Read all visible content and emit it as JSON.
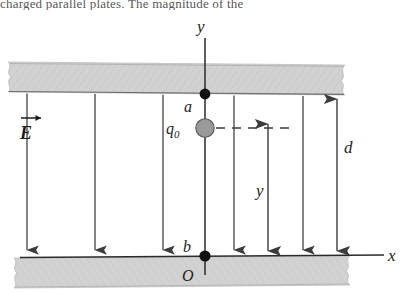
{
  "figure": {
    "kind": "physics-diagram",
    "clipped_caption_text": "charged parallel plates.  The magnitude of the",
    "background_color": "#ffffff",
    "ink_color": "#1d1d1d"
  },
  "plates": {
    "top": {
      "name": "upper charged plate",
      "fill_color": "#d0d0d0",
      "edge_style": "torn-jagged"
    },
    "bottom": {
      "name": "lower charged plate",
      "fill_color": "#d0d0d0",
      "edge_style": "torn-jagged"
    }
  },
  "axes": {
    "y_label": "y",
    "x_label": "x",
    "origin_label": "O"
  },
  "points": {
    "a_label": "a",
    "b_label": "b"
  },
  "charge": {
    "label": "q",
    "label_subscript": "0",
    "fill_color": "#9a9a9a"
  },
  "field": {
    "vector_label": "E",
    "direction": "downward",
    "line_count": 7,
    "arrow_color": "#3c3c3c"
  },
  "dimensions": {
    "y_label": "y",
    "d_label": "d"
  }
}
